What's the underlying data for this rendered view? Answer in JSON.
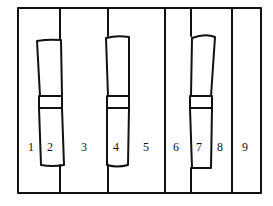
{
  "diagram": {
    "stroke_color": "#111111",
    "background": "#ffffff",
    "region_labels": [
      "1",
      "2",
      "3",
      "4",
      "5",
      "6",
      "7",
      "8",
      "9"
    ]
  }
}
